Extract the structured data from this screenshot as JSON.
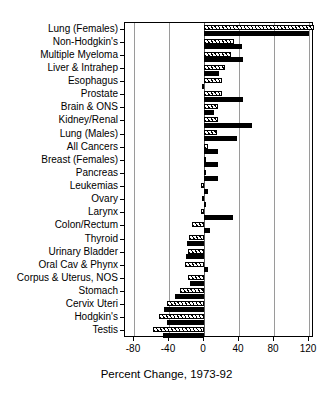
{
  "chart_data": {
    "type": "bar",
    "orientation": "horizontal",
    "title": "",
    "xlabel": "Percent Change, 1973-92",
    "ylabel": "",
    "xlim": [
      -80,
      130
    ],
    "xticks": [
      -80,
      -40,
      0,
      40,
      80,
      120
    ],
    "xtick_labels": [
      "-80",
      "-40",
      "0",
      "40",
      "80",
      "120"
    ],
    "grid": "vertical",
    "legend": "none",
    "categories": [
      "Lung (Females)",
      "Non-Hodgkin's",
      "Multiple Myeloma",
      "Liver & Intrahep",
      "Esophagus",
      "Prostate",
      "Brain & ONS",
      "Kidney/Renal",
      "Lung (Males)",
      "All Cancers",
      "Breast (Females)",
      "Pancreas",
      "Leukemias",
      "Ovary",
      "Larynx",
      "Colon/Rectum",
      "Thyroid",
      "Urinary Bladder",
      "Oral Cav & Phynx",
      "Corpus & Uterus, NOS",
      "Stomach",
      "Cervix Uteri",
      "Hodgkin's",
      "Testis"
    ],
    "series": [
      {
        "name": "hatched",
        "style": "hatched",
        "values": [
          126,
          34,
          31,
          24,
          21,
          21,
          16,
          16,
          15,
          4,
          2,
          0,
          -4,
          -2,
          -3,
          -14,
          -17,
          -18,
          -22,
          -18,
          -27,
          -42,
          -52,
          -58
        ]
      },
      {
        "name": "solid",
        "style": "solid-black",
        "values": [
          120,
          43,
          45,
          17,
          -2,
          44,
          11,
          55,
          38,
          16,
          16,
          16,
          5,
          1,
          33,
          7,
          -20,
          -21,
          4,
          -16,
          -33,
          -46,
          -42,
          -47
        ]
      }
    ]
  }
}
